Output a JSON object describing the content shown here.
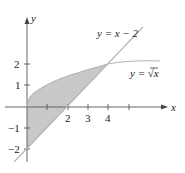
{
  "figure": {
    "type": "region-between-curves",
    "curves": [
      {
        "label": "y = x − 2",
        "expr": "x-2"
      },
      {
        "label": "y = √x",
        "expr": "sqrt(x)"
      }
    ],
    "axes": {
      "x_label": "x",
      "y_label": "y",
      "x_ticks": [
        {
          "value": 1,
          "label": ""
        },
        {
          "value": 2,
          "label": "2"
        },
        {
          "value": 3,
          "label": "3"
        },
        {
          "value": 4,
          "label": "4"
        },
        {
          "value": 5,
          "label": ""
        }
      ],
      "y_ticks": [
        {
          "value": 2,
          "label": "2"
        },
        {
          "value": 1,
          "label": "1"
        },
        {
          "value": -1,
          "label": "−1"
        },
        {
          "value": -2,
          "label": "−2"
        }
      ]
    },
    "shaded_region": {
      "x_from": 0,
      "x_to": 4,
      "color": "#c8c8c8"
    },
    "colors": {
      "axis": "#555555",
      "curve": "#b5b5b5",
      "fill": "#c8c8c8",
      "text": "#222222"
    }
  },
  "labels": {
    "line": "y = x − 2",
    "sqrt_prefix": "y = ",
    "sqrt_arg": "x",
    "x_axis": "x",
    "y_axis": "y",
    "tick_x2": "2",
    "tick_x3": "3",
    "tick_x4": "4",
    "tick_y2": "2",
    "tick_y1": "1",
    "tick_ym1": "−1",
    "tick_ym2": "−2"
  }
}
